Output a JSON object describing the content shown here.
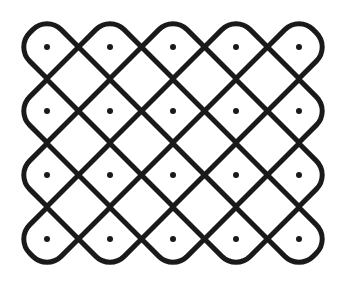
{
  "diagram": {
    "type": "kolam",
    "grid": {
      "rows": 4,
      "cols": 5
    },
    "dot_x": [
      47,
      110,
      173,
      236,
      299
    ],
    "dot_y": [
      47,
      111,
      175,
      239
    ],
    "half_diagonal": 31.5,
    "corner_radius": 20,
    "stroke_width": 5,
    "dot_radius": 3,
    "line_color": "#1a1a1a",
    "background": "#ffffff"
  }
}
